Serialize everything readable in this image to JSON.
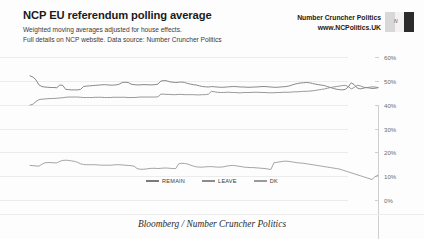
{
  "header": {
    "title": "NCP EU referendum polling average",
    "subtitle_line1": "Weighted moving averages adjusted for house effects.",
    "subtitle_line2": "Full details on NCP website. Data source: Number Cruncher Politics",
    "brand_name": "Number Cruncher Politics",
    "brand_url": "www.NCPolitics.UK",
    "logo_letter": "N"
  },
  "footer": {
    "credit": "Bloomberg / Number Cruncher Politics"
  },
  "chart_data": {
    "type": "line",
    "title": "NCP EU referendum polling average",
    "subtitle": "Weighted moving averages adjusted for house effects.",
    "xlabel": "",
    "ylabel": "",
    "ylim": [
      0,
      60
    ],
    "ytick_labels": [
      "0%",
      "10%",
      "20%",
      "30%",
      "40%",
      "50%",
      "60%"
    ],
    "ytick_values": [
      0,
      10,
      20,
      30,
      40,
      50,
      60
    ],
    "grid": true,
    "legend_position": "center",
    "xtick_labels": [
      "Sep 15",
      "Oct 15",
      "Nov 15",
      "Dec 15",
      "Jan 16",
      "Feb 16",
      "Mar 16",
      "Apr 16",
      "May 16",
      "Jun 16"
    ],
    "x_start": "Sep 15",
    "x_end": "Jun 16",
    "colors": {
      "remain": "#7a7a7a",
      "leave": "#8c8c8c",
      "dk": "#9a9a9a",
      "grid": "#ececec",
      "axis": "#cfcfcf"
    },
    "series": [
      {
        "name": "REMAIN",
        "color": "#7a7a7a",
        "values": [
          52.1,
          51.6,
          50.4,
          48.3,
          47.6,
          47.4,
          47.3,
          47.2,
          47.2,
          47.1,
          48.2,
          48.1,
          46.4,
          46.3,
          46.2,
          46.2,
          46.2,
          46.4,
          47.6,
          47.8,
          47.9,
          48.0,
          48.1,
          48.2,
          48.3,
          48.4,
          48.3,
          48.2,
          48.2,
          48.3,
          48.6,
          49.3,
          49.4,
          49.3,
          48.6,
          48.4,
          48.3,
          48.3,
          48.4,
          48.4,
          48.3,
          48.3,
          48.4,
          48.6,
          49.9,
          50.1,
          50.0,
          49.6,
          49.4,
          49.3,
          49.4,
          49.5,
          49.3,
          48.9,
          48.6,
          48.4,
          48.2,
          47.9,
          47.6,
          47.5,
          47.4,
          47.6,
          47.5,
          47.4,
          47.3,
          47.3,
          47.4,
          47.5,
          47.6,
          47.6,
          47.5,
          47.4,
          47.4,
          47.3,
          47.3,
          47.4,
          47.4,
          47.5,
          47.6,
          47.6,
          47.5,
          47.4,
          47.3,
          47.3,
          47.4,
          47.5,
          47.6,
          47.8,
          48.2,
          48.6,
          48.9,
          49.1,
          49.2,
          49.3,
          49.2,
          48.9,
          48.6,
          48.4,
          48.2,
          48.0,
          47.6,
          47.2,
          46.8,
          46.5,
          46.3,
          46.2,
          46.4,
          47.4,
          49.2,
          48.4,
          47.0,
          46.6,
          46.9,
          47.2,
          47.0,
          46.8,
          46.9,
          47.1
        ]
      },
      {
        "name": "LEAVE",
        "color": "#8c8c8c",
        "values": [
          39.8,
          40.2,
          41.3,
          42.1,
          42.3,
          42.4,
          42.5,
          42.6,
          42.6,
          42.7,
          42.8,
          42.9,
          43.1,
          43.2,
          43.2,
          43.2,
          43.2,
          43.1,
          43.0,
          43.0,
          43.0,
          43.0,
          43.1,
          43.1,
          43.1,
          43.0,
          43.0,
          43.0,
          43.1,
          43.1,
          43.1,
          43.1,
          43.1,
          43.0,
          43.0,
          43.0,
          43.1,
          43.2,
          43.2,
          43.2,
          43.2,
          43.2,
          43.2,
          43.3,
          44.4,
          44.4,
          44.3,
          44.3,
          44.2,
          44.2,
          44.3,
          44.3,
          44.2,
          44.2,
          44.2,
          44.2,
          44.1,
          44.1,
          44.2,
          44.2,
          44.4,
          45.6,
          45.4,
          45.2,
          45.1,
          45.1,
          45.2,
          45.2,
          45.1,
          45.1,
          45.0,
          45.0,
          45.1,
          45.1,
          45.1,
          45.2,
          45.2,
          45.2,
          45.1,
          45.1,
          45.0,
          45.0,
          45.0,
          45.1,
          45.1,
          45.2,
          45.2,
          45.2,
          45.3,
          45.4,
          45.4,
          45.5,
          45.6,
          45.6,
          45.7,
          45.8,
          46.0,
          46.2,
          46.4,
          46.6,
          46.9,
          47.2,
          47.4,
          47.6,
          47.8,
          48.0,
          48.1,
          47.6,
          46.6,
          47.2,
          48.1,
          47.9,
          47.4,
          47.1,
          47.3,
          47.5,
          47.4,
          47.2
        ]
      },
      {
        "name": "DK",
        "color": "#9a9a9a",
        "values": [
          8.1,
          8.2,
          8.3,
          9.6,
          10.1,
          10.2,
          10.2,
          10.2,
          10.2,
          10.2,
          9.0,
          9.0,
          10.5,
          10.5,
          10.6,
          10.6,
          10.6,
          10.5,
          9.4,
          9.2,
          9.1,
          9.0,
          8.8,
          8.7,
          8.6,
          8.6,
          8.7,
          8.8,
          8.7,
          8.6,
          8.3,
          7.6,
          7.5,
          7.7,
          8.4,
          8.6,
          8.6,
          8.5,
          8.4,
          8.4,
          8.5,
          8.5,
          8.4,
          8.1,
          5.7,
          5.5,
          5.7,
          6.1,
          6.4,
          6.5,
          6.3,
          6.2,
          6.5,
          6.9,
          7.2,
          7.4,
          7.7,
          8.0,
          8.2,
          8.3,
          8.2,
          6.8,
          7.1,
          7.4,
          7.6,
          7.6,
          7.4,
          7.3,
          7.3,
          7.3,
          7.5,
          7.6,
          7.5,
          7.6,
          7.6,
          7.4,
          7.4,
          7.3,
          7.3,
          7.3,
          7.5,
          7.6,
          7.7,
          7.6,
          7.5,
          7.3,
          7.2,
          7.0,
          6.5,
          6.0,
          5.7,
          5.4,
          5.2,
          5.1,
          5.1,
          5.3,
          5.4,
          5.4,
          5.4,
          5.4,
          5.5,
          5.6,
          5.8,
          5.9,
          5.9,
          5.8,
          5.5,
          5.0,
          4.2,
          4.4,
          4.9,
          5.5,
          5.7,
          5.7,
          5.7,
          5.7,
          5.7,
          5.7
        ]
      }
    ],
    "dk_plot_values": [
      14.5,
      14.4,
      14.3,
      14.2,
      15.0,
      15.6,
      15.7,
      15.7,
      15.6,
      15.6,
      16.2,
      16.6,
      16.7,
      16.6,
      16.4,
      16.2,
      15.8,
      15.2,
      14.9,
      14.8,
      14.8,
      14.8,
      14.8,
      14.7,
      14.6,
      14.6,
      14.6,
      14.6,
      14.7,
      14.8,
      14.8,
      14.7,
      14.6,
      14.5,
      14.4,
      14.2,
      13.2,
      12.9,
      12.9,
      13.0,
      13.2,
      13.3,
      13.3,
      13.2,
      13.3,
      13.4,
      13.4,
      13.3,
      13.2,
      13.2,
      15.2,
      15.4,
      15.3,
      15.1,
      14.6,
      14.2,
      13.9,
      13.8,
      13.8,
      13.9,
      14.0,
      14.0,
      13.9,
      13.8,
      13.8,
      13.9,
      14.2,
      14.4,
      14.5,
      14.4,
      14.2,
      14.0,
      13.8,
      13.7,
      13.6,
      13.6,
      13.5,
      13.4,
      13.3,
      13.2,
      13.0,
      12.8,
      15.6,
      15.8,
      16.0,
      16.2,
      16.3,
      16.2,
      16.0,
      15.8,
      15.6,
      15.5,
      15.4,
      15.2,
      15.0,
      14.8,
      14.6,
      14.4,
      14.2,
      14.0,
      13.8,
      13.6,
      13.4,
      13.2,
      13.0,
      12.6,
      12.2,
      11.8,
      11.4,
      11.0,
      10.6,
      10.2,
      9.8,
      9.4,
      9.0,
      8.6,
      9.8,
      10.4
    ]
  },
  "legend": {
    "items": [
      {
        "label": "REMAIN",
        "color": "#7a7a7a"
      },
      {
        "label": "LEAVE",
        "color": "#8c8c8c"
      },
      {
        "label": "DK",
        "color": "#9a9a9a"
      }
    ]
  }
}
